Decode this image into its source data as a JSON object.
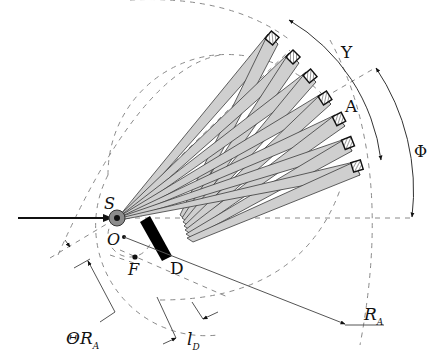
{
  "figure": {
    "type": "geometry schematic",
    "labels": {
      "source": "S",
      "origin": "O",
      "focus": "F",
      "detector_block": "D",
      "arc_point": "A",
      "angle_upsilon": "Υ",
      "angle_phi": "Φ",
      "theta_ra_main": "ΘR",
      "theta_ra_sub": "A",
      "ld_main": "l",
      "ld_sub": "D",
      "ra_main": "R",
      "ra_sub": "A"
    },
    "detector_count": 7,
    "colors": {
      "beam_fill": "#cfcfcf",
      "beam_stroke": "#3a3a3a",
      "dashed": "#8a8a8a",
      "ink": "#111111",
      "source_ring": "#8c8c8c"
    }
  }
}
